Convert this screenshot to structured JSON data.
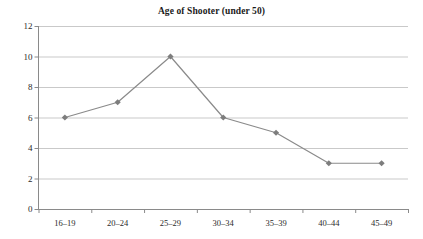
{
  "chart_data": {
    "type": "line",
    "title": "Age of Shooter (under 50)",
    "xlabel": "",
    "ylabel": "",
    "categories": [
      "16–19",
      "20–24",
      "25–29",
      "30–34",
      "35–39",
      "40–44",
      "45–49"
    ],
    "values": [
      6,
      7,
      10,
      6,
      5,
      3,
      3
    ],
    "ylim": [
      0,
      12
    ],
    "yticks": [
      0,
      2,
      4,
      6,
      8,
      10,
      12
    ],
    "ytick_labels": [
      "0",
      "2",
      "4",
      "6",
      "8",
      "10",
      "12"
    ],
    "grid": "horizontal",
    "legend": "none",
    "series": [
      {
        "name": "Age of Shooter (under 50)",
        "values": [
          6,
          7,
          10,
          6,
          5,
          3,
          3
        ]
      }
    ],
    "marker": "diamond",
    "line_color": "#8a8a8a",
    "marker_color": "#7d7d7d",
    "grid_color": "#c9c9c9",
    "axis_color": "#8a8a8a",
    "background_color": "#ffffff",
    "text_color": "#2b2b2b"
  }
}
